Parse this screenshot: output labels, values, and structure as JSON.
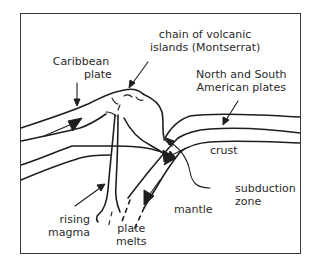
{
  "diagram": {
    "labels": {
      "caribbean_plate": [
        "Caribbean",
        "plate"
      ],
      "volcanic_chain": [
        "chain of volcanic",
        "islands (Montserrat)"
      ],
      "american_plates": [
        "North and South",
        "American plates"
      ],
      "crust": "crust",
      "subduction_zone": [
        "subduction",
        "zone"
      ],
      "mantle": "mantle",
      "rising_magma": [
        "rising",
        "magma"
      ],
      "plate_melts": [
        "plate",
        "melts"
      ]
    },
    "colors": {
      "line": "#1e1e1e",
      "text": "#2a2a2a",
      "background": "#ffffff"
    }
  }
}
